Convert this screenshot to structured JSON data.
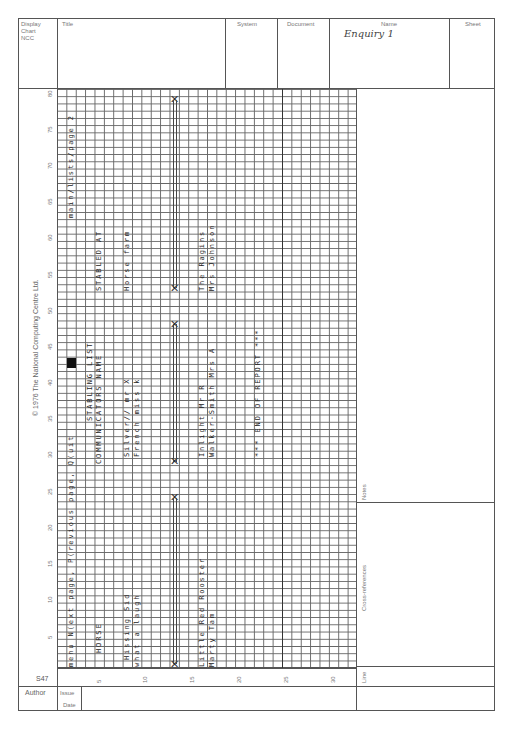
{
  "header": {
    "form_id": [
      "Display",
      "Chart",
      "NCC"
    ],
    "title_label": "Title",
    "system_label": "System",
    "document_label": "Document",
    "name_label": "Name",
    "name_value": "Enquiry 1",
    "sheet_label": "Sheet"
  },
  "copyright": "© 1976 The National Computing Centre Ltd.",
  "form_code": "S47",
  "grid": {
    "columns": 32,
    "rows": 80,
    "row_ticks": [
      "5",
      "10",
      "15",
      "20",
      "25",
      "30",
      "35",
      "40",
      "45",
      "50",
      "55",
      "60",
      "65",
      "70",
      "75",
      "80"
    ],
    "col_ticks": [
      "5",
      "10",
      "15",
      "20",
      "25",
      "30"
    ]
  },
  "screen_text": [
    {
      "id": "menu",
      "text": "menu  N(ext page, P(revious page, Q(uit",
      "col": 2,
      "row": 1
    },
    {
      "id": "main-lists",
      "text": "main/lists/page 2",
      "col": 2,
      "row": 63
    },
    {
      "id": "stabling-list",
      "text": "STABLING LIST",
      "col": 4,
      "row": 35
    },
    {
      "id": "horse",
      "text": "HORSE",
      "col": 5,
      "row": 3
    },
    {
      "id": "communicators-name",
      "text": "COMMUNICATORS NAME",
      "col": 5,
      "row": 29
    },
    {
      "id": "stabled-at",
      "text": "STABLED AT",
      "col": 5,
      "row": 53
    },
    {
      "id": "hissing-sid",
      "text": "Hissing Sid",
      "col": 8,
      "row": 2
    },
    {
      "id": "silver",
      "text": "Silver//  mr X",
      "col": 8,
      "row": 30
    },
    {
      "id": "horse-farm",
      "text": "Horse farm",
      "col": 8,
      "row": 53
    },
    {
      "id": "what-a-laugh",
      "text": "what a laugh",
      "col": 9,
      "row": 1
    },
    {
      "id": "french",
      "text": "French  miss k",
      "col": 9,
      "row": 30
    },
    {
      "id": "little-red-rooster",
      "text": "Little Red Rooster",
      "col": 16,
      "row": 1
    },
    {
      "id": "inlight",
      "text": "Inlight  Mr R",
      "col": 16,
      "row": 30
    },
    {
      "id": "the-ragins",
      "text": "The Ragins",
      "col": 16,
      "row": 53
    },
    {
      "id": "marty-tam",
      "text": "Marty Tam",
      "col": 17,
      "row": 1
    },
    {
      "id": "walker-smith",
      "text": "Walker-Smith  Mrs A",
      "col": 17,
      "row": 30
    },
    {
      "id": "mrs-johnson",
      "text": "Mrs Johnson",
      "col": 17,
      "row": 53
    },
    {
      "id": "end-of-report",
      "text": "*** END OF REPORT ***",
      "col": 22,
      "row": 30
    }
  ],
  "cursor_block": {
    "col": 2,
    "row": 43
  },
  "crosses": [
    {
      "col": 13,
      "row": 1
    },
    {
      "col": 13,
      "row": 24
    },
    {
      "col": 13,
      "row": 29
    },
    {
      "col": 13,
      "row": 48
    },
    {
      "col": 13,
      "row": 53
    },
    {
      "col": 13,
      "row": 79
    }
  ],
  "side_panel": {
    "notes_label": "Notes",
    "cross_references_label": "Cross-references",
    "line_label": "Line"
  },
  "footer": {
    "author_label": "Author",
    "issue_label": "Issue",
    "date_label": "Date"
  }
}
